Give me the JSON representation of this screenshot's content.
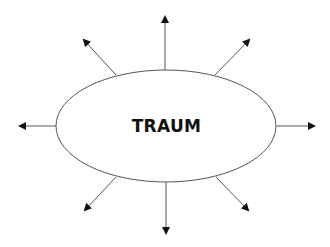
{
  "diagram": {
    "center_label": "TRAUM",
    "shape": "ellipse",
    "arrow_count": 8,
    "arrow_directions": [
      "up",
      "up-right",
      "right",
      "down-right",
      "down",
      "down-left",
      "left",
      "up-left"
    ],
    "colors": {
      "stroke": "#555555",
      "arrow": "#111111",
      "text": "#111111",
      "background": "#ffffff"
    }
  }
}
